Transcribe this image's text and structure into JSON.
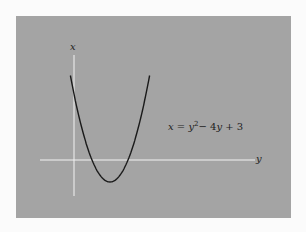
{
  "chart_data": {
    "type": "line",
    "title": "",
    "equation": "x = y² − 4y + 3",
    "xlabel": "y",
    "ylabel": "x",
    "grid": false,
    "legend": null,
    "series": [
      {
        "name": "x = y^2 - 4y + 3",
        "x": [
          -0.2,
          0,
          0.5,
          1,
          1.5,
          2,
          2.5,
          3,
          3.5,
          4,
          4.2
        ],
        "values": [
          3.84,
          3,
          1.25,
          0,
          -0.75,
          -1,
          -0.75,
          0,
          1.25,
          3,
          3.84
        ]
      }
    ],
    "xlim": [
      -1.9,
      10
    ],
    "ylim": [
      -1.6,
      4.8
    ],
    "annotations": [
      {
        "text": "x = y² − 4y + 3",
        "position": "right of curve"
      }
    ],
    "colors": {
      "background": "#a4a4a4",
      "axes": "#f0f0f0",
      "curve": "#1a1a1a"
    }
  },
  "labels": {
    "vertical_axis": "x",
    "horizontal_axis": "y",
    "eq_x": "x",
    "eq_eq": " = ",
    "eq_y": "y",
    "eq_sup": "2",
    "eq_rest1": "− 4",
    "eq_y2": "y",
    "eq_rest2": " + 3"
  }
}
